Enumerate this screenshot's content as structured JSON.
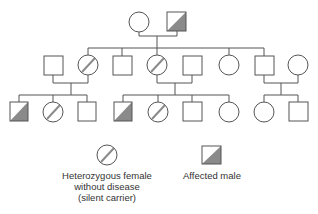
{
  "diagram": {
    "type": "pedigree",
    "colors": {
      "line": "#555555",
      "fill_affected": "#8a8a8a",
      "carrier_slash": "#8a8a8a"
    },
    "generations": [
      {
        "id": "I",
        "members": [
          {
            "id": "I-1",
            "sex": "female",
            "status": "unaffected"
          },
          {
            "id": "I-2",
            "sex": "male",
            "status": "affected"
          }
        ]
      },
      {
        "id": "II",
        "members": [
          {
            "id": "II-1",
            "sex": "male",
            "status": "unaffected",
            "note": "spouse"
          },
          {
            "id": "II-2",
            "sex": "female",
            "status": "carrier"
          },
          {
            "id": "II-3",
            "sex": "male",
            "status": "unaffected"
          },
          {
            "id": "II-4",
            "sex": "female",
            "status": "carrier"
          },
          {
            "id": "II-5",
            "sex": "male",
            "status": "unaffected",
            "note": "spouse"
          },
          {
            "id": "II-6",
            "sex": "female",
            "status": "unaffected"
          },
          {
            "id": "II-7",
            "sex": "male",
            "status": "unaffected"
          },
          {
            "id": "II-8",
            "sex": "female",
            "status": "unaffected",
            "note": "spouse"
          }
        ]
      },
      {
        "id": "III",
        "members": [
          {
            "id": "III-1",
            "sex": "male",
            "status": "affected"
          },
          {
            "id": "III-2",
            "sex": "female",
            "status": "carrier"
          },
          {
            "id": "III-3",
            "sex": "male",
            "status": "unaffected"
          },
          {
            "id": "III-4",
            "sex": "male",
            "status": "affected"
          },
          {
            "id": "III-5",
            "sex": "female",
            "status": "carrier"
          },
          {
            "id": "III-6",
            "sex": "male",
            "status": "unaffected"
          },
          {
            "id": "III-7",
            "sex": "female",
            "status": "unaffected"
          },
          {
            "id": "III-8",
            "sex": "female",
            "status": "unaffected"
          },
          {
            "id": "III-9",
            "sex": "male",
            "status": "unaffected"
          }
        ]
      }
    ]
  },
  "legend": {
    "carrier": {
      "symbol": "circle-with-slash",
      "line1": "Heterozygous female",
      "line2": "without disease",
      "line3": "(silent carrier)"
    },
    "affected": {
      "symbol": "half-shaded-square",
      "label": "Affected male"
    }
  }
}
